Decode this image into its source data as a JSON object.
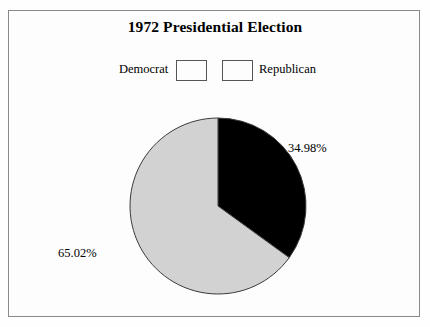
{
  "figure": {
    "title": "1972 Presidential Election",
    "border_color": "#8a8a8a",
    "background": "#fdfdfd"
  },
  "legend": {
    "position": "top-center",
    "entries": [
      {
        "label": "Democrat",
        "color": "#d2d2d2",
        "swatch_name": "legend-swatch-democrat"
      },
      {
        "label": "Republican",
        "color": "#000000",
        "swatch_name": "legend-swatch-republican"
      }
    ]
  },
  "labels": {
    "republican_pct": "34.98%",
    "democrat_pct": "65.02%"
  },
  "chart_data": {
    "type": "pie",
    "title": "1972 Presidential Election",
    "subtitle": "",
    "xlabel": "",
    "ylabel": "",
    "grid": false,
    "legend_position": "top-center",
    "start_angle_deg": 90,
    "direction": "clockwise",
    "categories": [
      "Republican",
      "Democrat"
    ],
    "values": [
      34.98,
      65.02
    ],
    "value_unit": "percent",
    "data_labels": [
      "34.98%",
      "65.02%"
    ],
    "colors": [
      "#000000",
      "#d2d2d2"
    ],
    "slices": [
      {
        "name": "Republican",
        "value": 34.98,
        "label": "34.98%",
        "color": "#000000",
        "start_deg": 0,
        "sweep_deg": 125.93
      },
      {
        "name": "Democrat",
        "value": 65.02,
        "label": "65.02%",
        "color": "#d2d2d2",
        "start_deg": 125.93,
        "sweep_deg": 234.07
      }
    ],
    "annotations": []
  }
}
